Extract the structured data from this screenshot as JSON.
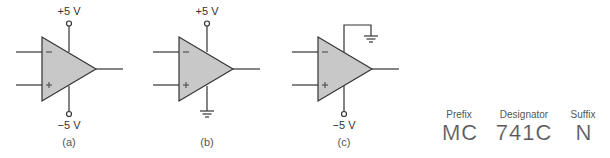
{
  "colors": {
    "opamp_fill": "#c8c8c8",
    "line": "#333333",
    "text": "#333333"
  },
  "circuits": [
    {
      "id": "a",
      "caption": "(a)",
      "inverting_symbol": "−",
      "noninverting_symbol": "+",
      "top_supply": "+5 V",
      "bottom_supply": "−5 V",
      "top_connection": "positive-supply",
      "bottom_connection": "negative-supply"
    },
    {
      "id": "b",
      "caption": "(b)",
      "inverting_symbol": "−",
      "noninverting_symbol": "+",
      "top_supply": "+5 V",
      "top_connection": "positive-supply",
      "bottom_connection": "ground"
    },
    {
      "id": "c",
      "caption": "(c)",
      "inverting_symbol": "−",
      "noninverting_symbol": "+",
      "bottom_supply": "−5 V",
      "top_connection": "ground",
      "bottom_connection": "negative-supply"
    }
  ],
  "part_number": {
    "prefix_label": "Prefix",
    "prefix_value": "MC",
    "designator_label": "Designator",
    "designator_value": "741C",
    "suffix_label": "Suffix",
    "suffix_value": "N"
  }
}
